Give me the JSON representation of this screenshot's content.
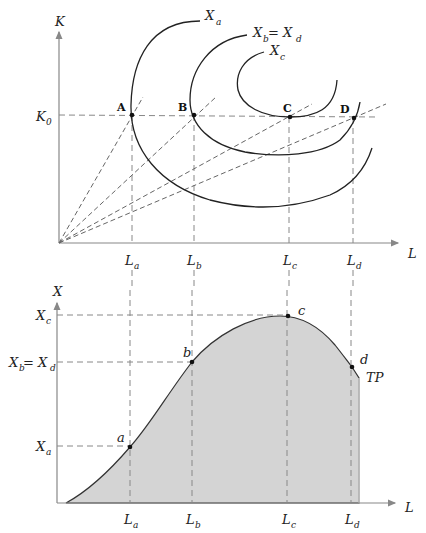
{
  "figure": {
    "top_panel": {
      "y_axis_label": "K",
      "x_axis_label": "L",
      "k_level_label": {
        "base": "K",
        "sub": "0"
      },
      "points": [
        {
          "name": "A",
          "x_tick": {
            "base": "L",
            "sub": "a"
          }
        },
        {
          "name": "B",
          "x_tick": {
            "base": "L",
            "sub": "b"
          }
        },
        {
          "name": "C",
          "x_tick": {
            "base": "L",
            "sub": "c"
          }
        },
        {
          "name": "D",
          "x_tick": {
            "base": "L",
            "sub": "d"
          }
        }
      ],
      "isoquants": [
        {
          "label_base": "X",
          "label_sub": "a"
        },
        {
          "label_base": "X",
          "label_sub": "b",
          "label_eq": " = X",
          "label_sub2": "d"
        },
        {
          "label_base": "X",
          "label_sub": "c"
        }
      ]
    },
    "bottom_panel": {
      "y_axis_label": "X",
      "x_axis_label": "L",
      "curve_label": "TP",
      "y_ticks": [
        {
          "base": "X",
          "sub": "c"
        },
        {
          "base": "X",
          "sub": "b",
          "eq": " = X",
          "sub2": "d"
        },
        {
          "base": "X",
          "sub": "a"
        }
      ],
      "points": [
        {
          "name": "a",
          "x_tick": {
            "base": "L",
            "sub": "a"
          }
        },
        {
          "name": "b",
          "x_tick": {
            "base": "L",
            "sub": "b"
          }
        },
        {
          "name": "c",
          "x_tick": {
            "base": "L",
            "sub": "c"
          }
        },
        {
          "name": "d",
          "x_tick": {
            "base": "L",
            "sub": "d"
          }
        }
      ]
    },
    "colors": {
      "area_fill": "#d4d4d4",
      "curve": "#222222",
      "guide": "#888888"
    }
  }
}
